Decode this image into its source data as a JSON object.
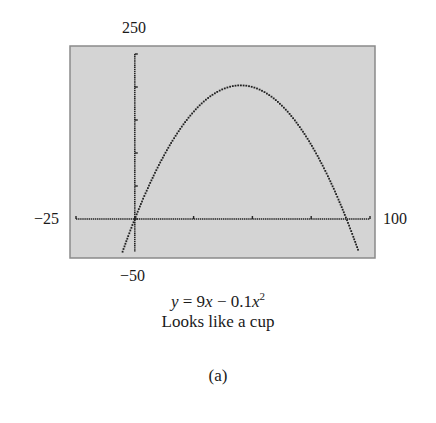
{
  "chart_data": {
    "type": "line",
    "subtitle": "Looks like a cup",
    "panel_label": "(a)",
    "function": "y = 9x - 0.1x^2",
    "xlim": [
      -25,
      100
    ],
    "ylim": [
      -50,
      250
    ],
    "x_tick_labels": {
      "min": "−25",
      "max": "100"
    },
    "y_tick_labels": {
      "min": "−50",
      "max": "250"
    },
    "x_ticks": [
      -25,
      0,
      25,
      50,
      75,
      100
    ],
    "y_ticks": [
      0,
      50,
      100,
      150,
      200,
      250
    ],
    "grid": false,
    "series": [
      {
        "name": "y = 9x − 0.1x²",
        "x": [
          -5,
          0,
          10,
          20,
          30,
          40,
          45,
          50,
          60,
          70,
          80,
          90,
          95
        ],
        "values": [
          -47.5,
          0,
          80,
          140,
          180,
          200,
          202.5,
          200,
          180,
          140,
          80,
          0,
          -47.5
        ]
      }
    ],
    "colors": {
      "background": "#d4d4d4",
      "curve": "#222222",
      "axes": "#222222"
    }
  },
  "labels": {
    "y_max": "250",
    "y_min": "−50",
    "x_min": "−25",
    "x_max": "100",
    "eq_y": "y",
    "eq_mid": " = 9",
    "eq_x1": "x",
    "eq_minus": " − 0.1",
    "eq_x2": "x",
    "eq_exp": "2",
    "subtitle": "Looks like a cup",
    "panel": "(a)"
  }
}
